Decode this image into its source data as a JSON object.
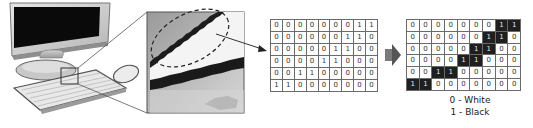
{
  "illustration": {
    "computer": "desktop monitor with keyboard and mouse",
    "zoom_region": "enlarged pixelated view of keyboard edge",
    "highlight": "dashed ellipse around diagonal pixel edge"
  },
  "matrix_input": {
    "rows": [
      [
        0,
        0,
        0,
        0,
        0,
        0,
        0,
        1,
        1
      ],
      [
        0,
        0,
        0,
        0,
        0,
        0,
        1,
        1,
        0
      ],
      [
        0,
        0,
        0,
        0,
        0,
        1,
        1,
        0,
        0
      ],
      [
        0,
        0,
        0,
        0,
        1,
        1,
        0,
        0,
        0
      ],
      [
        0,
        0,
        1,
        1,
        0,
        0,
        0,
        0,
        0
      ],
      [
        1,
        1,
        0,
        0,
        0,
        0,
        0,
        0,
        0
      ]
    ]
  },
  "matrix_output": {
    "rows": [
      [
        0,
        0,
        0,
        0,
        0,
        0,
        0,
        1,
        1
      ],
      [
        0,
        0,
        0,
        0,
        0,
        0,
        1,
        1,
        0
      ],
      [
        0,
        0,
        0,
        0,
        0,
        1,
        1,
        0,
        0
      ],
      [
        0,
        0,
        0,
        0,
        1,
        1,
        0,
        0,
        0
      ],
      [
        0,
        0,
        1,
        1,
        0,
        0,
        0,
        0,
        0
      ],
      [
        1,
        1,
        0,
        0,
        0,
        0,
        0,
        0,
        0
      ]
    ],
    "colors": {
      "0": "#ffffff",
      "1": "#1f1f1f"
    }
  },
  "legend": {
    "zero": "0 - White",
    "one": "1 - Black"
  }
}
